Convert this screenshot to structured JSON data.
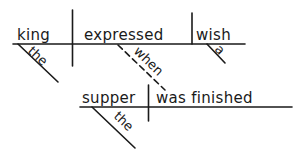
{
  "diagram": {
    "type": "reed-kellogg-sentence-diagram",
    "main_clause": {
      "subject": "king",
      "subject_modifier": "the",
      "verb": "expressed",
      "object": "wish",
      "object_modifier": "a"
    },
    "connector": {
      "word": "when",
      "style": "dashed"
    },
    "subordinate_clause": {
      "subject": "supper",
      "subject_modifier": "the",
      "verb": "was finished"
    }
  },
  "colors": {
    "ink": "#1a1a1a",
    "background": "#ffffff"
  }
}
